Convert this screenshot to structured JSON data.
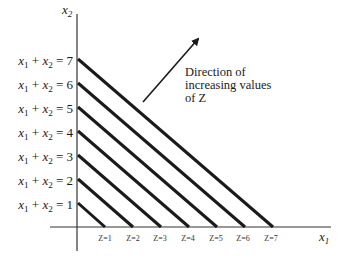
{
  "figure": {
    "type": "linear-programming isoprofit diagram",
    "axes": {
      "x_label": "x",
      "x_label_sub": "1",
      "y_label": "x",
      "y_label_sub": "2"
    },
    "lines": [
      {
        "k": 1,
        "equation": "x1 + x2 = 1",
        "z_label": "Z=1"
      },
      {
        "k": 2,
        "equation": "x1 + x2 = 2",
        "z_label": "Z=2"
      },
      {
        "k": 3,
        "equation": "x1 + x2 = 3",
        "z_label": "Z=3"
      },
      {
        "k": 4,
        "equation": "x1 + x2 = 4",
        "z_label": "Z=4"
      },
      {
        "k": 5,
        "equation": "x1 + x2 = 5",
        "z_label": "Z=5"
      },
      {
        "k": 6,
        "equation": "x1 + x2 = 6",
        "z_label": "Z=6"
      },
      {
        "k": 7,
        "equation": "x1 + x2 = 7",
        "z_label": "Z=7"
      }
    ],
    "eq_parts": {
      "x": "x",
      "sub1": "1",
      "sub2": "2",
      "plus": " + ",
      "equals": " = "
    },
    "values": [
      "1",
      "2",
      "3",
      "4",
      "5",
      "6",
      "7"
    ],
    "z_labels": [
      "Z=1",
      "Z=2",
      "Z=3",
      "Z=4",
      "Z=5",
      "Z=6",
      "Z=7"
    ],
    "annotation": {
      "line1": "Direction of",
      "line2": "increasing values",
      "line3": "of Z"
    },
    "colors": {
      "line": "#1a1a1a",
      "axis": "#333333",
      "background": "#ffffff"
    }
  }
}
